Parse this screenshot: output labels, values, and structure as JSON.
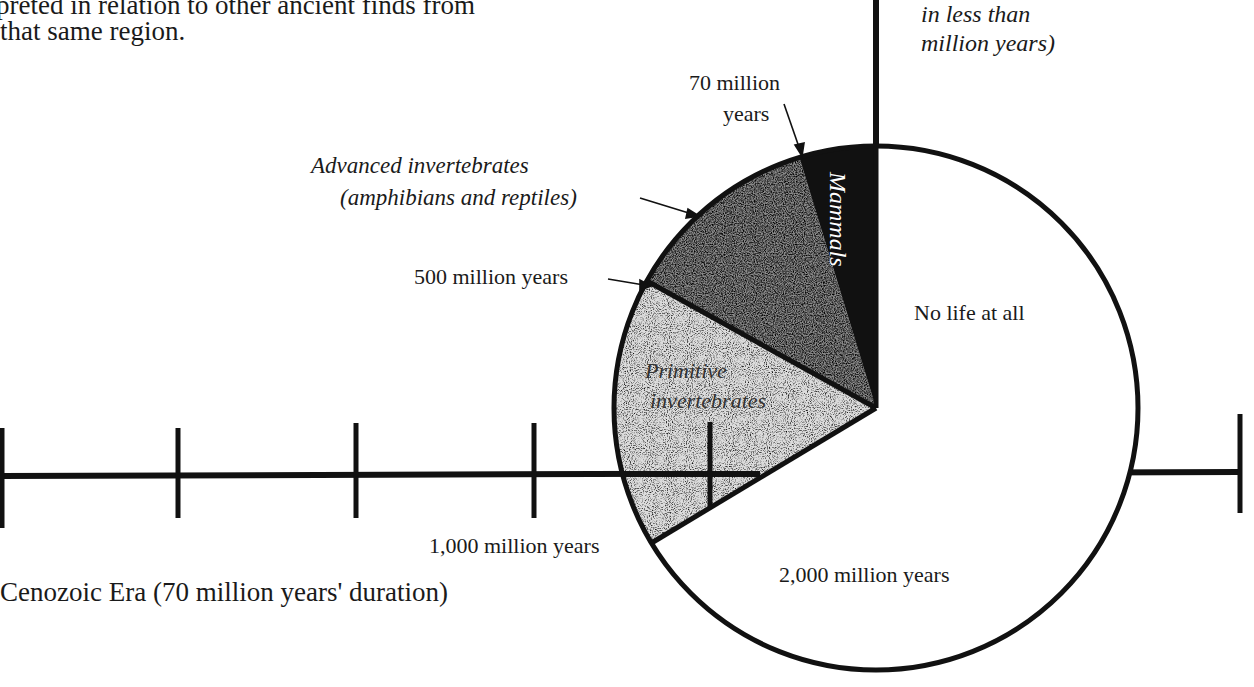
{
  "page_text": {
    "line1": "preted in relation to other ancient finds from",
    "line2": "that same region."
  },
  "top_right_note": {
    "line1": "in less than",
    "line2": "million years)"
  },
  "diagram": {
    "title_caption": "Cenozoic Era (70 million years' duration)",
    "pie": {
      "center": [
        876,
        408
      ],
      "radius": 262,
      "segments": [
        {
          "name": "Mammals",
          "label": "Mammals",
          "fill": "#111111",
          "start_deg": 0,
          "end_deg": -17
        },
        {
          "name": "Advanced invertebrates",
          "label_line1": "Advanced invertebrates",
          "label_line2": "(amphibians and reptiles)",
          "fill": "stipple-dark",
          "start_deg": -17,
          "end_deg": -61
        },
        {
          "name": "Primitive invertebrates",
          "label_line1": "Primitive",
          "label_line2": "invertebrates",
          "fill": "stipple-light",
          "start_deg": -61,
          "end_deg": -121
        },
        {
          "name": "No life at all",
          "label": "No life at all",
          "fill": "#ffffff",
          "start_deg": -121,
          "end_deg": -360
        }
      ],
      "markers": {
        "m70": {
          "line1": "70 million",
          "line2": "years"
        },
        "m500": "500 million years",
        "m1000": "1,000 million years",
        "m2000": "2,000 million years"
      }
    },
    "timeline": {
      "y": 475,
      "ticks_x": [
        2,
        178,
        356,
        534,
        710,
        886,
        1063,
        1240
      ]
    }
  }
}
